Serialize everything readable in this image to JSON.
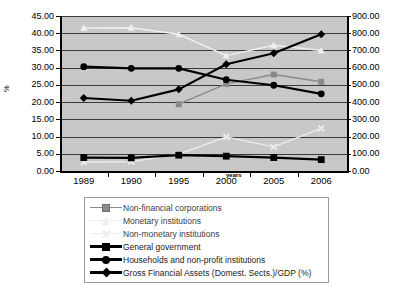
{
  "chart_data": {
    "type": "line",
    "title": "",
    "xlabel": "years",
    "ylabel": "%",
    "ylabel_right": "",
    "categories": [
      "1989",
      "1990",
      "1995",
      "2000",
      "2005",
      "2006"
    ],
    "ylim": [
      0,
      45
    ],
    "ylim_right": [
      0,
      900
    ],
    "ytick_labels": [
      "45.00",
      "40.00",
      "35.00",
      "30.00",
      "25.00",
      "20.00",
      "15.00",
      "10.00",
      "5.00",
      "0.00"
    ],
    "ytick_values": [
      45,
      40,
      35,
      30,
      25,
      20,
      15,
      10,
      5,
      0
    ],
    "ytick_labels_right": [
      "900.00",
      "800.00",
      "700.00",
      "600.00",
      "500.00",
      "400.00",
      "300.00",
      "200.00",
      "100.00",
      "0.00"
    ],
    "ytick_values_right": [
      900,
      800,
      700,
      600,
      500,
      400,
      300,
      200,
      100,
      0
    ],
    "grid": true,
    "legend_position": "bottom",
    "plot_background": "#c8c8c8",
    "series": [
      {
        "name": "Non-financial corporations",
        "marker": "square",
        "color": "#8a8a8a",
        "axis": "left",
        "values": [
          null,
          null,
          19.4,
          25.3,
          28.0,
          25.9
        ]
      },
      {
        "name": "Monetary institutions",
        "marker": "triangle",
        "color": "#efefef",
        "axis": "left",
        "values": [
          41.5,
          41.6,
          39.7,
          33.5,
          36.5,
          35.0
        ]
      },
      {
        "name": "Non-monetary institutions",
        "marker": "x",
        "color": "#ececec",
        "axis": "left",
        "values": [
          2.6,
          2.7,
          4.9,
          9.9,
          7.0,
          12.4
        ]
      },
      {
        "name": "General government",
        "marker": "square",
        "color": "#000000",
        "axis": "left",
        "values": [
          3.9,
          3.8,
          4.6,
          4.3,
          3.9,
          3.3
        ]
      },
      {
        "name": "Households and non-profit institutions",
        "marker": "circle",
        "color": "#000000",
        "axis": "left",
        "values": [
          30.3,
          29.8,
          29.8,
          26.5,
          24.9,
          22.4
        ]
      },
      {
        "name": "Gross Financial Assets (Domest. Sects.)/GDP (%)",
        "marker": "diamond",
        "color": "#000000",
        "axis": "right",
        "values": [
          21.2,
          20.4,
          23.7,
          31.0,
          34.2,
          39.7
        ]
      }
    ]
  },
  "legend": {
    "items": [
      {
        "label": "Non-financial corporations"
      },
      {
        "label": "Monetary institutions"
      },
      {
        "label": "Non-monetary institutions"
      },
      {
        "label": "General government"
      },
      {
        "label": "Households and non-profit institutions"
      },
      {
        "label": "Gross Financial Assets (Domest. Sects.)/GDP (%)"
      }
    ]
  }
}
